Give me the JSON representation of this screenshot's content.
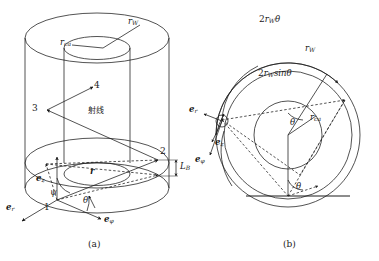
{
  "figure": {
    "kind": "technical-line-diagram",
    "background_color": "#ffffff",
    "stroke_color": "#1a1a1a",
    "panels": [
      {
        "id": "a",
        "caption": "(a)",
        "description": "3D perspective of annular cylinder with ray path",
        "labels": {
          "r_w": "r",
          "r_w_sub": "W",
          "r_ca": "r",
          "r_ca_sub": "ca",
          "r_vec": "r",
          "e_z": "e",
          "e_z_sub": "z",
          "e_r": "e",
          "e_r_sub": "r",
          "e_phi": "e",
          "e_phi_sub": "φ",
          "psi": "ψ",
          "theta": "θ",
          "L_B": "L",
          "L_B_sub": "B",
          "ray_text": "射线",
          "point_1": "1",
          "point_2": "2",
          "point_3": "3",
          "point_4": "4"
        }
      },
      {
        "id": "b",
        "caption": "(b)",
        "description": "Top view of annulus showing chord and arc relations",
        "labels": {
          "arc_len": "2r",
          "arc_len_sub": "W",
          "arc_len_tail": "θ",
          "chord": "2r",
          "chord_sub": "W",
          "chord_tail": "sinθ",
          "r_w": "r",
          "r_w_sub": "W",
          "r_ca": "r",
          "r_ca_sub": "ca",
          "theta_center": "θ",
          "theta_bottom": "θ",
          "e_r": "e",
          "e_r_sub": "r",
          "e_z": "e",
          "e_z_sub": "z",
          "e_phi": "e",
          "e_phi_sub": "φ"
        }
      }
    ]
  }
}
